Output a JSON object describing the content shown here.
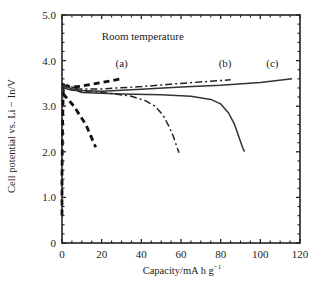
{
  "chart_data": {
    "type": "line",
    "title": "",
    "annotations": [
      {
        "text": "Room temperature",
        "x": 20,
        "y": 4.45
      },
      {
        "text": "(a)",
        "x": 27,
        "y": 3.85
      },
      {
        "text": "(b)",
        "x": 79,
        "y": 3.85
      },
      {
        "text": "(c)",
        "x": 103,
        "y": 3.85
      }
    ],
    "xlabel": "Capacity/mA h g",
    "xlabel_sup": "−1",
    "ylabel": "Cell potential vs. Li − In/V",
    "xlim": [
      0,
      120
    ],
    "ylim": [
      0,
      5.0
    ],
    "x_ticks": [
      0,
      20,
      40,
      60,
      80,
      100,
      120
    ],
    "x_tick_labels": [
      "0",
      "20",
      "40",
      "60",
      "80",
      "100",
      "120"
    ],
    "y_ticks": [
      0,
      1.0,
      2.0,
      3.0,
      4.0,
      5.0
    ],
    "y_tick_labels": [
      "0",
      "1.0",
      "2.0",
      "3.0",
      "4.0",
      "5.0"
    ],
    "grid": false,
    "legend": "none",
    "series": [
      {
        "name": "(a) charge",
        "style": "heavy-dashed",
        "x": [
          0,
          0,
          0.3,
          0.6,
          1,
          5,
          10,
          15,
          20,
          25,
          30
        ],
        "y": [
          0.6,
          1.5,
          2.6,
          3.3,
          3.45,
          3.42,
          3.44,
          3.48,
          3.52,
          3.56,
          3.6
        ]
      },
      {
        "name": "(a) discharge",
        "style": "heavy-dashed",
        "x": [
          0.5,
          1,
          3,
          6,
          9,
          12,
          14,
          16,
          17
        ],
        "y": [
          3.5,
          3.25,
          3.15,
          3.0,
          2.8,
          2.6,
          2.4,
          2.2,
          2.1
        ]
      },
      {
        "name": "(b) charge",
        "style": "dash-dot",
        "x": [
          0,
          1,
          5,
          20,
          40,
          60,
          85
        ],
        "y": [
          3.4,
          3.45,
          3.38,
          3.38,
          3.43,
          3.5,
          3.58
        ]
      },
      {
        "name": "(b) discharge",
        "style": "dash-dot",
        "x": [
          0,
          1,
          10,
          25,
          35,
          42,
          47,
          51,
          54,
          56,
          58,
          59
        ],
        "y": [
          3.35,
          3.5,
          3.33,
          3.28,
          3.22,
          3.12,
          3.0,
          2.8,
          2.55,
          2.35,
          2.1,
          1.98
        ]
      },
      {
        "name": "(c) charge",
        "style": "solid",
        "x": [
          0,
          1,
          5,
          20,
          40,
          60,
          80,
          100,
          116
        ],
        "y": [
          3.3,
          3.4,
          3.35,
          3.33,
          3.37,
          3.42,
          3.46,
          3.52,
          3.6
        ]
      },
      {
        "name": "(c) discharge",
        "style": "solid",
        "x": [
          0,
          1,
          10,
          30,
          50,
          65,
          75,
          80,
          84,
          87,
          89,
          91,
          92
        ],
        "y": [
          3.3,
          3.45,
          3.3,
          3.27,
          3.25,
          3.22,
          3.15,
          3.05,
          2.85,
          2.6,
          2.35,
          2.1,
          2.0
        ]
      }
    ]
  }
}
